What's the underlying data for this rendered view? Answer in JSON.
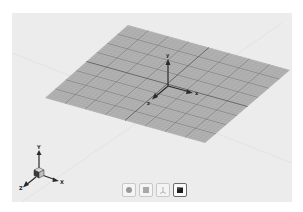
{
  "viewport": {
    "background_color": "#ececec",
    "plane_color": "#b3b3b3",
    "grid_line_color": "#8a8a8a",
    "major_line_color": "#555555"
  },
  "world_gizmo": {
    "labels": {
      "x": "x",
      "y": "y",
      "z": "z"
    }
  },
  "orientation_gizmo": {
    "labels": {
      "x": "X",
      "y": "Y",
      "z": "Z"
    }
  },
  "toolbar": {
    "buttons": [
      {
        "icon": "sphere-view-icon",
        "active": false
      },
      {
        "icon": "square-view-icon",
        "active": false
      },
      {
        "icon": "transform-view-icon",
        "active": false
      },
      {
        "icon": "cube-view-icon",
        "active": true
      }
    ]
  }
}
